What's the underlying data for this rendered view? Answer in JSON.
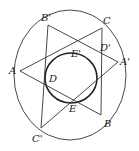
{
  "figure": {
    "points": {
      "A": {
        "label": "A",
        "x": 20,
        "y": 71
      },
      "B": {
        "label": "B",
        "x": 101,
        "y": 115
      },
      "C": {
        "label": "C",
        "x": 102,
        "y": 28
      },
      "A'": {
        "label": "A'",
        "x": 118,
        "y": 62
      },
      "B'": {
        "label": "B'",
        "x": 48,
        "y": 25
      },
      "C'": {
        "label": "C'",
        "x": 41,
        "y": 128
      }
    },
    "inner_labels": {
      "D": {
        "label": "D",
        "x": 49,
        "y": 82
      },
      "D'": {
        "label": "D'",
        "x": 100,
        "y": 51
      },
      "E": {
        "label": "E",
        "x": 69,
        "y": 112
      },
      "E'": {
        "label": "E'",
        "x": 71,
        "y": 57
      }
    },
    "outer_ellipse": {
      "cx": 70,
      "cy": 75,
      "rx": 56,
      "ry": 65
    },
    "inner_ellipse": {
      "cx": 71,
      "cy": 78,
      "rx": 26,
      "ry": 25
    }
  },
  "labels": {
    "A": "A",
    "B": "B",
    "C": "C",
    "A_prime": "A'",
    "B_prime": "B'",
    "C_prime": "C'",
    "D": "D",
    "D_prime": "D'",
    "E": "E",
    "E_prime": "E'"
  }
}
